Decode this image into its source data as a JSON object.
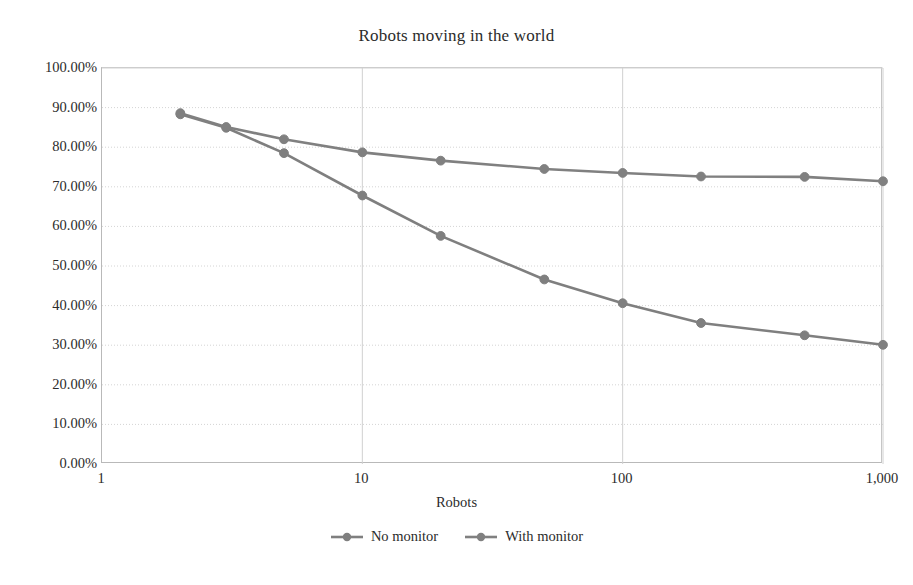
{
  "chart_data": {
    "type": "line",
    "title": "Robots moving in the world",
    "xlabel": "Robots",
    "ylabel": "",
    "xscale": "log",
    "xlim": [
      1,
      1000
    ],
    "ylim": [
      0,
      1
    ],
    "grid": true,
    "legend_position": "bottom",
    "x": [
      2,
      3,
      5,
      10,
      20,
      50,
      100,
      200,
      500,
      1000
    ],
    "xticks": [
      1,
      10,
      100,
      1000
    ],
    "xticklabels": [
      "1",
      "10",
      "100",
      "1,000"
    ],
    "yticks": [
      0,
      0.1,
      0.2,
      0.3,
      0.4,
      0.5,
      0.6,
      0.7,
      0.8,
      0.9,
      1.0
    ],
    "yticklabels": [
      "0.00%",
      "10.00%",
      "20.00%",
      "30.00%",
      "40.00%",
      "50.00%",
      "60.00%",
      "70.00%",
      "80.00%",
      "90.00%",
      "100.00%"
    ],
    "series": [
      {
        "name": "No monitor",
        "color": "#7f7f7f",
        "marker": "circle",
        "values": [
          0.883,
          0.849,
          0.785,
          0.678,
          0.576,
          0.466,
          0.406,
          0.356,
          0.325,
          0.301
        ]
      },
      {
        "name": "With monitor",
        "color": "#808080",
        "marker": "circle",
        "values": [
          0.886,
          0.851,
          0.82,
          0.787,
          0.766,
          0.745,
          0.735,
          0.726,
          0.725,
          0.714
        ]
      }
    ]
  }
}
